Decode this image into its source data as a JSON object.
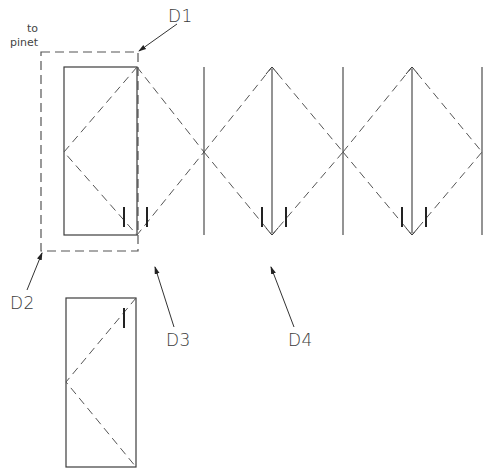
{
  "note": {
    "line1": "to",
    "line2": "pinet"
  },
  "callouts": {
    "d1": "D1",
    "d2": "D2",
    "d3": "D3",
    "d4": "D4"
  },
  "colors": {
    "line": "#3c3c3c",
    "dashed": "#555555",
    "background": "#ffffff"
  }
}
